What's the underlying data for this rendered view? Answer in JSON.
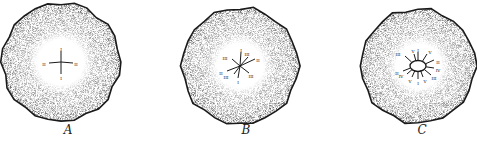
{
  "figure": {
    "colors": {
      "background": "#ffffff",
      "ink": "#1a1a1a",
      "stipple": "#8a8a8a"
    },
    "panels": [
      {
        "id": "A",
        "label": "A",
        "center": [
          61,
          62
        ],
        "radius": 59,
        "inner_radius": 22,
        "label_pos": [
          68,
          134
        ],
        "arms": [
          {
            "dx": 0,
            "dy": -11,
            "text": "I",
            "tx": 0,
            "ty": -13
          },
          {
            "dx": 0,
            "dy": 12,
            "text": "I",
            "tx": 0,
            "ty": 16
          },
          {
            "dx": -12,
            "dy": 1,
            "text": "II",
            "tx": -17,
            "ty": 2
          },
          {
            "dx": 12,
            "dy": 1,
            "text": "II",
            "tx": 15,
            "ty": 2
          }
        ]
      },
      {
        "id": "B",
        "label": "B",
        "center": [
          240,
          66
        ],
        "radius": 58,
        "inner_radius": 24,
        "label_pos": [
          246,
          134
        ],
        "arms": [
          {
            "dx": 1,
            "dy": -14,
            "text": "I",
            "tx": 1,
            "ty": -16
          },
          {
            "dx": -2,
            "dy": 12,
            "text": "I",
            "tx": -2,
            "ty": 16
          },
          {
            "dx": -13,
            "dy": 5,
            "text": "II",
            "tx": -19,
            "ty": 7
          },
          {
            "dx": 15,
            "dy": -7,
            "text": "II",
            "tx": 18,
            "ty": -6
          },
          {
            "dx": -8,
            "dy": -7,
            "text": "III",
            "tx": -15,
            "ty": -8
          },
          {
            "dx": 8,
            "dy": -9,
            "text": "III",
            "tx": 7,
            "ty": -12
          },
          {
            "dx": -6,
            "dy": 8,
            "text": "III",
            "tx": -14,
            "ty": 11
          },
          {
            "dx": 9,
            "dy": 7,
            "text": "III",
            "tx": 11,
            "ty": 10
          }
        ]
      },
      {
        "id": "C",
        "label": "C",
        "center": [
          418,
          66
        ],
        "radius": 57,
        "inner_radius": 26,
        "label_pos": [
          422,
          134
        ],
        "arms": [
          {
            "dx": 0,
            "dy": -14,
            "text": "I",
            "tx": 0,
            "ty": -16
          },
          {
            "dx": 0,
            "dy": 13,
            "text": "I",
            "tx": 0,
            "ty": 17
          },
          {
            "dx": 16,
            "dy": -6,
            "text": "II",
            "tx": 20,
            "ty": -4
          },
          {
            "dx": -15,
            "dy": 5,
            "text": "II",
            "tx": -21,
            "ty": 7
          },
          {
            "dx": -13,
            "dy": -10,
            "text": "III",
            "tx": -20,
            "ty": -12
          },
          {
            "dx": 13,
            "dy": 9,
            "text": "III",
            "tx": 16,
            "ty": 12
          },
          {
            "dx": 16,
            "dy": 2,
            "text": "IV",
            "tx": 20,
            "ty": 4
          },
          {
            "dx": -11,
            "dy": 8,
            "text": "IV",
            "tx": -17,
            "ty": 10
          },
          {
            "dx": -4,
            "dy": -12,
            "text": "V",
            "tx": -5,
            "ty": -15
          },
          {
            "dx": 9,
            "dy": -12,
            "text": "V",
            "tx": 12,
            "ty": -14
          },
          {
            "dx": -6,
            "dy": 11,
            "text": "V",
            "tx": -8,
            "ty": 15
          },
          {
            "dx": 5,
            "dy": 11,
            "text": "V",
            "tx": 7,
            "ty": 15
          }
        ]
      }
    ]
  }
}
